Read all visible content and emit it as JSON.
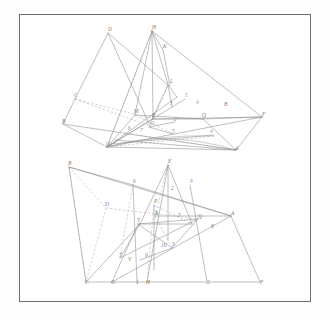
{
  "sheet": {
    "title": "Descriptive geometry construction plate",
    "background_color": "#ffffff",
    "border_color": "#6e6e6e",
    "line_color": "#8a8a8a",
    "label_color": "#7b7b7b",
    "figures": [
      {
        "id": "figure-top",
        "name": "upper-construction",
        "points": [
          {
            "label": "D",
            "x": 108,
            "y": 31
          },
          {
            "label": "H",
            "x": 152,
            "y": 29
          },
          {
            "label": "K",
            "x": 163,
            "y": 48
          },
          {
            "label": "L",
            "x": 170,
            "y": 83
          },
          {
            "label": "C",
            "x": 74,
            "y": 97
          },
          {
            "label": "B",
            "x": 62,
            "y": 123
          },
          {
            "label": "E",
            "x": 152,
            "y": 117
          },
          {
            "label": "B",
            "x": 224,
            "y": 106
          },
          {
            "label": "F",
            "x": 262,
            "y": 116
          },
          {
            "label": "A",
            "x": 235,
            "y": 150
          },
          {
            "label": "G",
            "x": 106,
            "y": 146
          },
          {
            "label": "M",
            "x": 134,
            "y": 113
          },
          {
            "label": "O",
            "x": 150,
            "y": 125
          },
          {
            "label": "Q",
            "x": 202,
            "y": 117
          }
        ],
        "numbered": [
          {
            "label": "5",
            "x": 185,
            "y": 97
          },
          {
            "label": "4",
            "x": 196,
            "y": 104
          },
          {
            "label": "3",
            "x": 170,
            "y": 105
          },
          {
            "label": "2",
            "x": 174,
            "y": 121
          },
          {
            "label": "6",
            "x": 128,
            "y": 130
          },
          {
            "label": "7",
            "x": 140,
            "y": 132
          },
          {
            "label": "5",
            "x": 172,
            "y": 133
          },
          {
            "label": "4",
            "x": 210,
            "y": 133
          }
        ]
      },
      {
        "id": "figure-bottom",
        "name": "lower-construction",
        "points": [
          {
            "label": "B",
            "x": 68,
            "y": 165
          },
          {
            "label": "E",
            "x": 168,
            "y": 163
          },
          {
            "label": "6",
            "x": 133,
            "y": 183
          },
          {
            "label": "3",
            "x": 190,
            "y": 183
          },
          {
            "label": "2",
            "x": 171,
            "y": 190
          },
          {
            "label": "D",
            "x": 105,
            "y": 206
          },
          {
            "label": "P",
            "x": 154,
            "y": 203
          },
          {
            "label": "R",
            "x": 155,
            "y": 215
          },
          {
            "label": "5",
            "x": 178,
            "y": 217
          },
          {
            "label": "Q",
            "x": 198,
            "y": 218
          },
          {
            "label": "A",
            "x": 231,
            "y": 215
          },
          {
            "label": "8",
            "x": 211,
            "y": 228
          },
          {
            "label": "T",
            "x": 137,
            "y": 222
          },
          {
            "label": "7",
            "x": 119,
            "y": 257
          },
          {
            "label": "V",
            "x": 128,
            "y": 261
          },
          {
            "label": "9",
            "x": 145,
            "y": 257
          },
          {
            "label": "10",
            "x": 161,
            "y": 247
          },
          {
            "label": "S",
            "x": 172,
            "y": 246
          },
          {
            "label": "C",
            "x": 85,
            "y": 284
          },
          {
            "label": "G",
            "x": 111,
            "y": 284
          },
          {
            "label": "1",
            "x": 136,
            "y": 284
          },
          {
            "label": "H",
            "x": 146,
            "y": 284
          },
          {
            "label": "2",
            "x": 207,
            "y": 284
          },
          {
            "label": "F",
            "x": 260,
            "y": 284
          }
        ]
      }
    ]
  },
  "chart_data": {
    "type": "diagram",
    "subtype": "orthographic projection / intersection of planes",
    "figure_count": 2,
    "top_figure": {
      "vertex_labels": [
        "D",
        "H",
        "K",
        "L",
        "C",
        "B",
        "E",
        "B",
        "F",
        "A",
        "G",
        "M",
        "O",
        "Q"
      ],
      "numbered_labels": [
        "5",
        "4",
        "3",
        "2",
        "6",
        "7",
        "5",
        "4"
      ],
      "line_styles": [
        "solid",
        "dashed"
      ]
    },
    "bottom_figure": {
      "vertex_labels": [
        "B",
        "E",
        "D",
        "P",
        "R",
        "Q",
        "A",
        "T",
        "V",
        "S",
        "C",
        "G",
        "H",
        "F"
      ],
      "numbered_labels": [
        "6",
        "3",
        "2",
        "5",
        "8",
        "7",
        "9",
        "10",
        "1",
        "2"
      ],
      "line_styles": [
        "solid",
        "dashed"
      ]
    }
  }
}
